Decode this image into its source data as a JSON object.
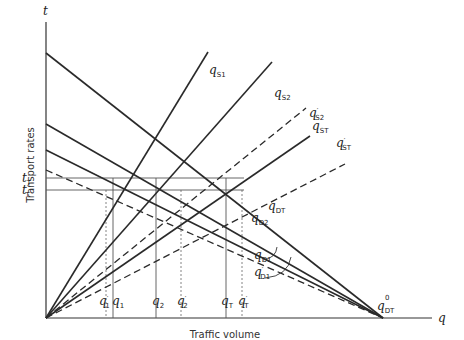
{
  "axes": {
    "y_symbol": "t",
    "x_symbol": "q",
    "y_title": "Transport rates",
    "x_title": "Traffic volume",
    "x_end_zero": "0",
    "x_end_label_main": "q",
    "x_end_label_sub": "DT"
  },
  "rate_levels": [
    {
      "main": "t",
      "sub": "T",
      "prime": ""
    },
    {
      "main": "t",
      "sub": "T",
      "prime": "′"
    }
  ],
  "volume_ticks": [
    {
      "main": "q",
      "sub": "1",
      "prime": "′",
      "style": "dashed"
    },
    {
      "main": "q",
      "sub": "1",
      "prime": "",
      "style": "solid"
    },
    {
      "main": "q",
      "sub": "2",
      "prime": "",
      "style": "solid"
    },
    {
      "main": "q",
      "sub": "2",
      "prime": "′",
      "style": "dashed"
    },
    {
      "main": "q",
      "sub": "T",
      "prime": "",
      "style": "solid"
    },
    {
      "main": "q",
      "sub": "T",
      "prime": "′",
      "style": "dashed"
    }
  ],
  "supply_curves": [
    {
      "main": "q",
      "sub": "S1",
      "prime": "",
      "style": "solid"
    },
    {
      "main": "q",
      "sub": "S2",
      "prime": "",
      "style": "solid"
    },
    {
      "main": "q",
      "sub": "S2",
      "prime": "′",
      "style": "dashed"
    },
    {
      "main": "q",
      "sub": "ST",
      "prime": "",
      "style": "solid"
    },
    {
      "main": "q",
      "sub": "ST",
      "prime": "′",
      "style": "dashed"
    }
  ],
  "demand_curves": [
    {
      "main": "q",
      "sub": "DT",
      "prime": "",
      "style": "solid"
    },
    {
      "main": "q",
      "sub": "D2",
      "prime": "",
      "style": "solid"
    },
    {
      "main": "q",
      "sub": "D1",
      "prime": "",
      "style": "solid"
    },
    {
      "main": "q",
      "sub": "D1",
      "prime": "′",
      "style": "dashed"
    }
  ]
}
